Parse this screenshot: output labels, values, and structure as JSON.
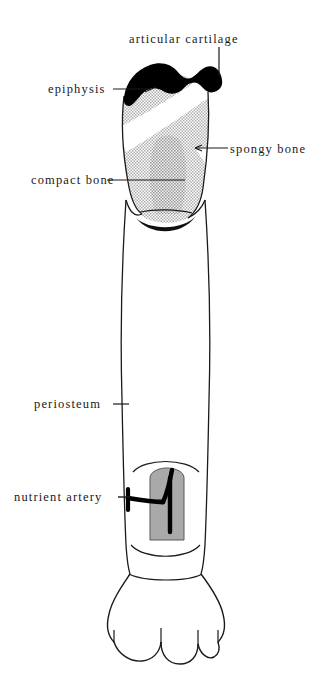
{
  "figure": {
    "background_color": "#ffffff",
    "ink_color": "#1a1a1a",
    "stipple_color": "#b9b9b9",
    "marrow_color": "#a8a8a8",
    "cartilage_color": "#000000"
  },
  "labels": {
    "articular_cartilage": "articular cartilage",
    "epiphysis": "epiphysis",
    "spongy_bone": "spongy bone",
    "compact_bone": "compact bone",
    "periosteum": "periosteum",
    "nutrient_artery": "nutrient artery"
  },
  "structures": [
    {
      "name": "articular-cartilage",
      "description": "thick black cap over proximal epiphysis"
    },
    {
      "name": "proximal-epiphysis",
      "description": "stippled head of bone"
    },
    {
      "name": "spongy-bone",
      "description": "stippled trabecular interior"
    },
    {
      "name": "compact-bone",
      "description": "dense outer wall of diaphysis"
    },
    {
      "name": "diaphysis",
      "description": "long shaft of the bone"
    },
    {
      "name": "periosteum",
      "description": "outer membrane covering the shaft"
    },
    {
      "name": "medullary-cavity",
      "description": "gray marrow cavity shown through cutaway window"
    },
    {
      "name": "nutrient-artery",
      "description": "black branching vessel entering the shaft"
    },
    {
      "name": "distal-epiphysis",
      "description": "condyles at the lower end"
    }
  ]
}
